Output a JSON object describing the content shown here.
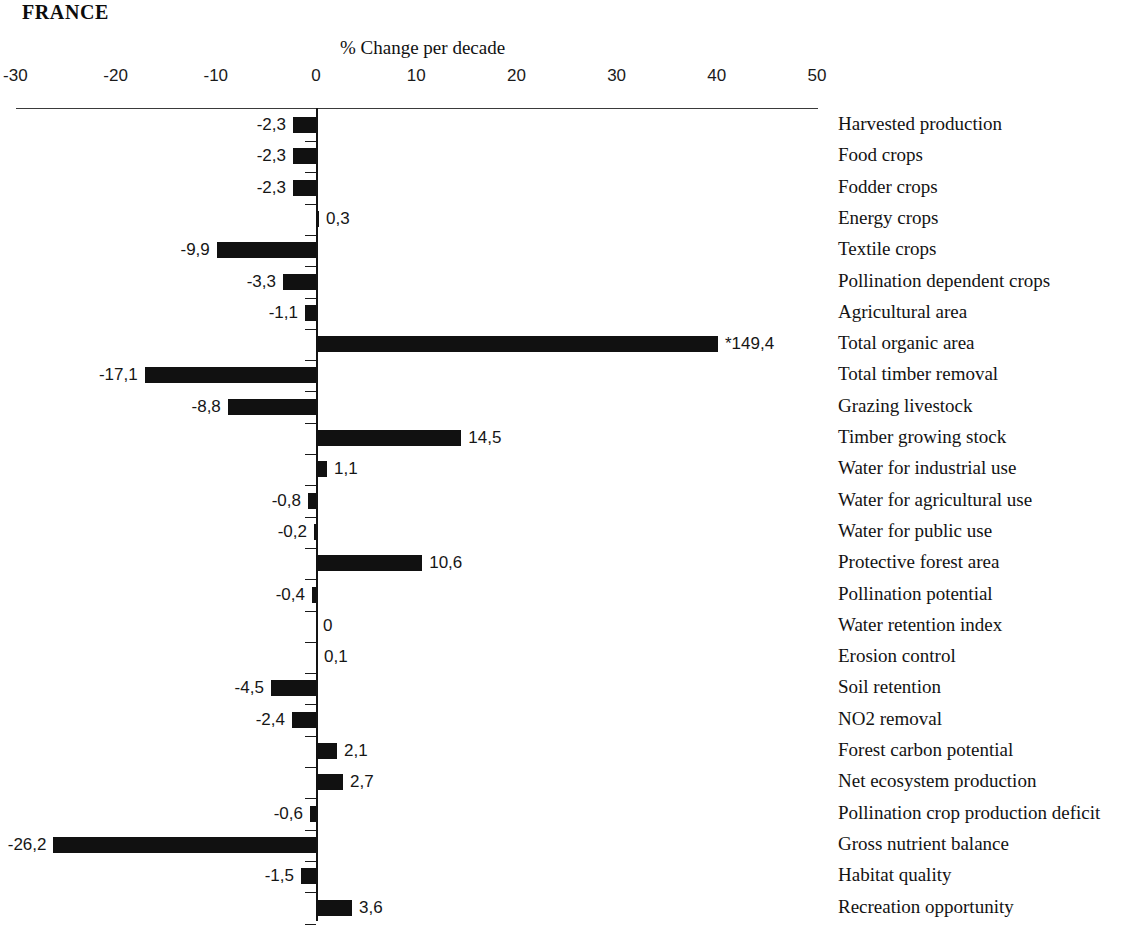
{
  "title": "FRANCE",
  "axis": {
    "title": "% Change per decade",
    "ticks": [
      "-30",
      "-20",
      "-10",
      "0",
      "10",
      "20",
      "30",
      "40",
      "50"
    ]
  },
  "chart_data": {
    "type": "bar",
    "orientation": "horizontal",
    "title": "FRANCE",
    "xlabel": "% Change per decade",
    "ylabel": "",
    "xlim": [
      -30,
      50
    ],
    "xticks": [
      -30,
      -20,
      -10,
      0,
      10,
      20,
      30,
      40,
      50
    ],
    "grid": false,
    "legend": false,
    "bar_color": "#111111",
    "note": "Asterisk (*) marks a value that exceeds the plotted axis range; its bar is truncated at the right edge.",
    "categories": [
      "Harvested production",
      "Food crops",
      "Fodder crops",
      "Energy crops",
      "Textile crops",
      "Pollination dependent crops",
      "Agricultural area",
      "Total organic area",
      "Total timber removal",
      "Grazing livestock",
      "Timber growing stock",
      "Water for industrial use",
      "Water for agricultural use",
      "Water for public use",
      "Protective forest area",
      "Pollination potential",
      "Water retention index",
      "Erosion control",
      "Soil retention",
      "NO2 removal",
      "Forest carbon potential",
      "Net ecosystem production",
      "Pollination crop production deficit",
      "Gross nutrient balance",
      "Habitat quality",
      "Recreation opportunity"
    ],
    "values": [
      -2.3,
      -2.3,
      -2.3,
      0.3,
      -9.9,
      -3.3,
      -1.1,
      149.4,
      -17.1,
      -8.8,
      14.5,
      1.1,
      -0.8,
      -0.2,
      10.6,
      -0.4,
      0,
      0.1,
      -4.5,
      -2.4,
      2.1,
      2.7,
      -0.6,
      -26.2,
      -1.5,
      3.6
    ],
    "value_labels": [
      "-2,3",
      "-2,3",
      "-2,3",
      "0,3",
      "-9,9",
      "-3,3",
      "-1,1",
      "*149,4",
      "-17,1",
      "-8,8",
      "14,5",
      "1,1",
      "-0,8",
      "-0,2",
      "10,6",
      "-0,4",
      "0",
      "0,1",
      "-4,5",
      "-2,4",
      "2,1",
      "2,7",
      "-0,6",
      "-26,2",
      "-1,5",
      "3,6"
    ]
  },
  "rows": [
    {
      "label": "Harvested production",
      "value": -2.3,
      "value_label": "-2,3"
    },
    {
      "label": "Food crops",
      "value": -2.3,
      "value_label": "-2,3"
    },
    {
      "label": "Fodder crops",
      "value": -2.3,
      "value_label": "-2,3"
    },
    {
      "label": "Energy crops",
      "value": 0.3,
      "value_label": "0,3"
    },
    {
      "label": "Textile crops",
      "value": -9.9,
      "value_label": "-9,9"
    },
    {
      "label": "Pollination dependent crops",
      "value": -3.3,
      "value_label": "-3,3"
    },
    {
      "label": "Agricultural area",
      "value": -1.1,
      "value_label": "-1,1"
    },
    {
      "label": "Total organic area",
      "value": 149.4,
      "value_label": "*149,4"
    },
    {
      "label": "Total timber removal",
      "value": -17.1,
      "value_label": "-17,1"
    },
    {
      "label": "Grazing livestock",
      "value": -8.8,
      "value_label": "-8,8"
    },
    {
      "label": "Timber growing stock",
      "value": 14.5,
      "value_label": "14,5"
    },
    {
      "label": "Water for industrial use",
      "value": 1.1,
      "value_label": "1,1"
    },
    {
      "label": "Water for agricultural use",
      "value": -0.8,
      "value_label": "-0,8"
    },
    {
      "label": "Water for public use",
      "value": -0.2,
      "value_label": "-0,2"
    },
    {
      "label": "Protective forest area",
      "value": 10.6,
      "value_label": "10,6"
    },
    {
      "label": "Pollination potential",
      "value": -0.4,
      "value_label": "-0,4"
    },
    {
      "label": "Water retention index",
      "value": 0,
      "value_label": "0"
    },
    {
      "label": "Erosion control",
      "value": 0.1,
      "value_label": "0,1"
    },
    {
      "label": "Soil retention",
      "value": -4.5,
      "value_label": "-4,5"
    },
    {
      "label": "NO2 removal",
      "value": -2.4,
      "value_label": "-2,4"
    },
    {
      "label": "Forest carbon potential",
      "value": 2.1,
      "value_label": "2,1"
    },
    {
      "label": "Net ecosystem production",
      "value": 2.7,
      "value_label": "2,7"
    },
    {
      "label": "Pollination crop production deficit",
      "value": -0.6,
      "value_label": "-0,6"
    },
    {
      "label": "Gross nutrient balance",
      "value": -26.2,
      "value_label": "-26,2"
    },
    {
      "label": "Habitat quality",
      "value": -1.5,
      "value_label": "-1,5"
    },
    {
      "label": "Recreation opportunity",
      "value": 3.6,
      "value_label": "3,6"
    }
  ]
}
